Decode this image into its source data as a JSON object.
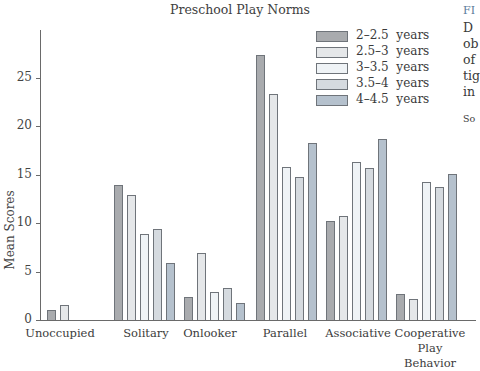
{
  "chart_data": {
    "type": "bar",
    "title": "Preschool Play Norms",
    "xlabel": "",
    "ylabel": "Mean Scores",
    "ylim": [
      0,
      30
    ],
    "yticks": [
      0,
      5,
      10,
      15,
      20,
      25
    ],
    "grid": false,
    "legend_position": "upper right",
    "categories": [
      "Unoccupied",
      "Solitary",
      "Onlooker",
      "Parallel",
      "Associative",
      "Cooperative Play Behavior"
    ],
    "series": [
      {
        "name": "2–2.5  years",
        "color": "#a9abae",
        "values": [
          1.0,
          13.9,
          2.4,
          27.3,
          10.2,
          2.7
        ]
      },
      {
        "name": "2.5–3  years",
        "color": "#e5e7e9",
        "values": [
          1.5,
          12.9,
          6.9,
          23.3,
          10.7,
          2.2
        ]
      },
      {
        "name": "3–3.5  years",
        "color": "#eff3f6",
        "values": [
          0,
          8.9,
          2.9,
          15.8,
          16.3,
          14.2
        ]
      },
      {
        "name": "3.5–4  years",
        "color": "#d5dadf",
        "values": [
          0,
          9.4,
          3.3,
          14.7,
          15.7,
          13.7
        ]
      },
      {
        "name": "4–4.5  years",
        "color": "#b5c1cd",
        "values": [
          0,
          5.9,
          1.8,
          18.2,
          18.7,
          15.1
        ]
      }
    ]
  },
  "axis": {
    "ylabel": "Mean Scores",
    "ticks": [
      "0",
      "5",
      "10",
      "15",
      "20",
      "25"
    ]
  },
  "categories_display": [
    {
      "line1": "Unoccupied",
      "line2": ""
    },
    {
      "line1": "Solitary",
      "line2": ""
    },
    {
      "line1": "Onlooker",
      "line2": ""
    },
    {
      "line1": "Parallel",
      "line2": ""
    },
    {
      "line1": "Associative",
      "line2": ""
    },
    {
      "line1": "Cooperative",
      "line2": "Play Behavior"
    }
  ],
  "caption_fragments": {
    "fig": "FI",
    "lines": [
      "D",
      "ob",
      "of",
      "tig",
      "in"
    ],
    "source": "So"
  }
}
